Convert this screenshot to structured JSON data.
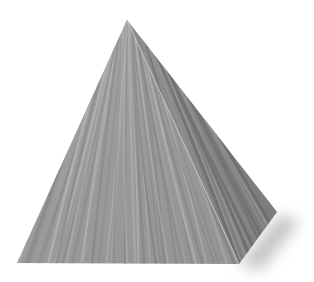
{
  "image": {
    "subject": "wood-textured pyramid",
    "background": "#ffffff",
    "width": 314,
    "height": 282
  },
  "pyramid": {
    "apex": [
      127,
      20
    ],
    "base_left": [
      17,
      263
    ],
    "base_front_right": [
      239,
      264
    ],
    "base_back_right": [
      277,
      212
    ],
    "front_face": {
      "base_color": "#9d9d9d",
      "streak_light": "#b8b8b8",
      "streak_dark": "#858585"
    },
    "right_face": {
      "base_color": "#8c8c8c",
      "streak_light": "#a6a6a6",
      "streak_dark": "#747474"
    },
    "ridge_highlight": "#c4c4c4",
    "shadow_color": "#bdbdbd"
  }
}
